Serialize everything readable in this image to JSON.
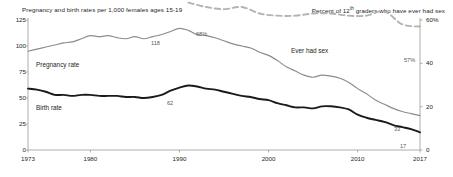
{
  "captions": {
    "left": "Pregnancy and birth rates per 1,000 females ages 15-19",
    "right_pre": "Percent of 12",
    "right_sup": "th",
    "right_post": " graders who have ever had sex"
  },
  "series_labels": {
    "pregnancy": "Pregnancy rate",
    "birth": "Birth rate",
    "ever_had_sex": "Ever had sex"
  },
  "point_labels": {
    "pregnancy_peak": "118",
    "sex_start": "68%",
    "birth_peak": "62",
    "pregnancy_end": "33",
    "birth_end": "17",
    "sex_end": "57%"
  },
  "colors": {
    "pregnancy": "#8c8c8c",
    "birth": "#1a1a1a",
    "ever_had_sex": "#b3b3b3",
    "axis": "#9a9a9a",
    "text": "#231f20"
  },
  "chart_data": {
    "type": "line",
    "title": "",
    "xlabel": "",
    "ylabel": "Pregnancy and birth rates per 1,000 females ages 15-19",
    "y2label": "Percent of 12th graders who have ever had sex",
    "grid": false,
    "legend": "inline-labels",
    "xlim": [
      1973,
      2017
    ],
    "ylim": [
      0,
      125
    ],
    "y2lim": [
      0,
      60
    ],
    "xticks": [
      1973,
      1980,
      1990,
      2000,
      2010,
      2017
    ],
    "xticklabels": [
      "1973",
      "1980",
      "1990",
      "2000",
      "2010",
      "2017"
    ],
    "yticks": [
      0,
      25,
      50,
      75,
      100,
      125
    ],
    "yticklabels": [
      "0",
      "25",
      "50",
      "75",
      "100",
      "125"
    ],
    "y2ticks": [
      0,
      20,
      40,
      60
    ],
    "y2ticklabels": [
      "0",
      "20",
      "40",
      "60%"
    ],
    "series": [
      {
        "name": "Pregnancy rate",
        "axis": "left",
        "style": "solid",
        "color": "#8c8c8c",
        "x": [
          1973,
          1974,
          1975,
          1976,
          1977,
          1978,
          1979,
          1980,
          1981,
          1982,
          1983,
          1984,
          1985,
          1986,
          1987,
          1988,
          1989,
          1990,
          1991,
          1992,
          1993,
          1994,
          1995,
          1996,
          1997,
          1998,
          1999,
          2000,
          2001,
          2002,
          2003,
          2004,
          2005,
          2006,
          2007,
          2008,
          2009,
          2010,
          2011,
          2012,
          2013,
          2014,
          2015,
          2016,
          2017
        ],
        "values": [
          95,
          97,
          99,
          101,
          103,
          104,
          107,
          110,
          109,
          110,
          108,
          107,
          109,
          107,
          109,
          111,
          114,
          117,
          115,
          111,
          110,
          108,
          105,
          102,
          100,
          98,
          94,
          91,
          86,
          80,
          76,
          72,
          70,
          72,
          71,
          69,
          65,
          59,
          54,
          48,
          44,
          40,
          37,
          35,
          33
        ]
      },
      {
        "name": "Birth rate",
        "axis": "left",
        "style": "solid",
        "color": "#1a1a1a",
        "x": [
          1973,
          1974,
          1975,
          1976,
          1977,
          1978,
          1979,
          1980,
          1981,
          1982,
          1983,
          1984,
          1985,
          1986,
          1987,
          1988,
          1989,
          1990,
          1991,
          1992,
          1993,
          1994,
          1995,
          1996,
          1997,
          1998,
          1999,
          2000,
          2001,
          2002,
          2003,
          2004,
          2005,
          2006,
          2007,
          2008,
          2009,
          2010,
          2011,
          2012,
          2013,
          2014,
          2015,
          2016,
          2017
        ],
        "values": [
          59,
          58,
          56,
          53,
          53,
          52,
          53,
          53,
          52,
          52,
          52,
          51,
          51,
          50,
          51,
          53,
          57,
          60,
          62,
          61,
          59,
          58,
          56,
          54,
          52,
          51,
          49,
          48,
          45,
          43,
          41,
          41,
          40,
          42,
          42,
          41,
          39,
          34,
          31,
          29,
          27,
          24,
          22,
          20,
          17
        ]
      },
      {
        "name": "Ever had sex",
        "axis": "right",
        "style": "dashed",
        "color": "#b3b3b3",
        "x": [
          1991,
          1993,
          1995,
          1997,
          1999,
          2001,
          2003,
          2005,
          2007,
          2009,
          2011,
          2013,
          2015,
          2017
        ],
        "values": [
          68,
          66,
          65,
          66,
          63,
          62,
          62,
          63,
          63,
          62,
          62,
          64,
          58,
          57
        ]
      }
    ]
  }
}
